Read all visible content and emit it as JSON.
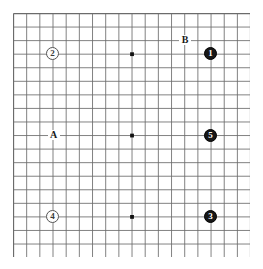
{
  "board": {
    "kind": "go-board",
    "size": 19,
    "columns": 19,
    "rows": 19,
    "origin_x": 13,
    "origin_y": 13,
    "spacing_x": 13.17,
    "spacing_y": 13.56,
    "line_color": "#6b6b6b",
    "border_color": "#4a4a4a",
    "background_color": "#ffffff",
    "star_point_color": "#111111",
    "star_points": [
      {
        "col": 3,
        "row": 3
      },
      {
        "col": 9,
        "row": 3
      },
      {
        "col": 15,
        "row": 3
      },
      {
        "col": 3,
        "row": 9
      },
      {
        "col": 9,
        "row": 9
      },
      {
        "col": 15,
        "row": 9
      },
      {
        "col": 3,
        "row": 15
      },
      {
        "col": 9,
        "row": 15
      },
      {
        "col": 15,
        "row": 15
      }
    ],
    "visible_star_points": [
      {
        "col": 9,
        "row": 3
      },
      {
        "col": 9,
        "row": 9
      },
      {
        "col": 9,
        "row": 15
      }
    ]
  },
  "stones": [
    {
      "id": "stone-1",
      "label": "1",
      "color": "black",
      "col": 15,
      "row": 3,
      "diameter": 13
    },
    {
      "id": "stone-2",
      "label": "2",
      "color": "white",
      "col": 3,
      "row": 3,
      "diameter": 13
    },
    {
      "id": "stone-3",
      "label": "3",
      "color": "black",
      "col": 15,
      "row": 15,
      "diameter": 13
    },
    {
      "id": "stone-4",
      "label": "4",
      "color": "white",
      "col": 3,
      "row": 15,
      "diameter": 13
    },
    {
      "id": "stone-5",
      "label": "5",
      "color": "black",
      "col": 15,
      "row": 9,
      "diameter": 13
    }
  ],
  "labels": [
    {
      "id": "label-a",
      "text": "A",
      "col": 3,
      "row": 9
    },
    {
      "id": "label-b",
      "text": "B",
      "col": 13,
      "row": 2
    }
  ],
  "colors": {
    "black_stone": "#171717",
    "white_stone": "#fdfdfd",
    "grid": "#6b6b6b",
    "label_text": "#1a1a1a"
  }
}
